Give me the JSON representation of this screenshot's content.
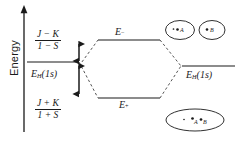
{
  "diagram": {
    "axis": {
      "label": "Energy",
      "arrow": "up-arrow-icon"
    },
    "colors": {
      "line": "#1a1a1a",
      "background": "#ffffff",
      "dashed": "#555555"
    },
    "splittings": {
      "upper": {
        "numerator": "J − K",
        "denominator": "1 − S"
      },
      "lower": {
        "numerator": "J + K",
        "denominator": "1 + S"
      }
    },
    "levels": {
      "atomic_left": {
        "base": "E",
        "sub": "H",
        "paren": "(1s)"
      },
      "atomic_right": {
        "base": "E",
        "sub": "H",
        "paren": "(1s)"
      },
      "antibonding": {
        "base": "E",
        "sub": "−"
      },
      "bonding": {
        "base": "E",
        "sub": "+"
      }
    },
    "orbital_sketches": {
      "antibonding": {
        "name": "two-lobe-antibonding-orbital",
        "lobes": [
          {
            "label": "A"
          },
          {
            "label": "B"
          }
        ]
      },
      "bonding": {
        "name": "single-lobe-bonding-orbital",
        "labels": [
          "A",
          "B"
        ]
      }
    }
  }
}
